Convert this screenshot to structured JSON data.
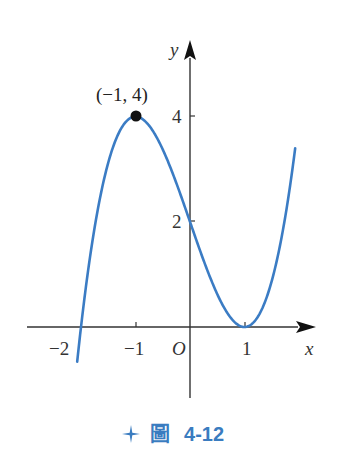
{
  "chart_data": {
    "type": "line",
    "function": "y = x^3 - 3x + 2",
    "title": "",
    "xlabel": "x",
    "ylabel": "y",
    "origin_label": "O",
    "x_ticks": [
      -2,
      -1,
      1
    ],
    "x_tick_labels": [
      "−2",
      "−1",
      "1"
    ],
    "y_ticks": [
      2,
      4
    ],
    "y_tick_labels": [
      "2",
      "4"
    ],
    "xlim": [
      -2.9,
      2.3
    ],
    "ylim": [
      -1.4,
      5.3
    ],
    "grid": false,
    "legend": null,
    "series": [
      {
        "name": "curve",
        "color": "#3b7cc4",
        "x_range": [
          -2.07,
          1.93
        ]
      }
    ],
    "annotations": [
      {
        "point": [
          -1,
          4
        ],
        "label": "(−1, 4)",
        "marker": "filled-circle"
      }
    ],
    "key_points": [
      {
        "x": -2,
        "y": 0
      },
      {
        "x": -1,
        "y": 4
      },
      {
        "x": 0,
        "y": 2
      },
      {
        "x": 1,
        "y": 0
      }
    ]
  },
  "caption": {
    "icon": "four-point-star-icon",
    "label": "圖",
    "number": "4-12",
    "color": "#3a7cc0"
  }
}
